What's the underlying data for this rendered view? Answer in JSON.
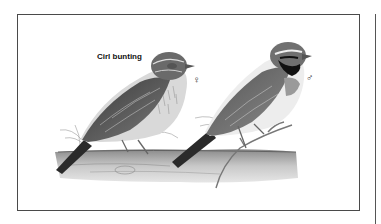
{
  "plate": {
    "caption": "Cirl bunting",
    "female_symbol": "♀",
    "male_symbol": "♂"
  },
  "colors": {
    "frame": "#4a4a4a",
    "ink_dark": "#1e1e1e",
    "ink_mid": "#6a6a6a",
    "ink_light": "#b5b5b5",
    "paper": "#ffffff"
  }
}
